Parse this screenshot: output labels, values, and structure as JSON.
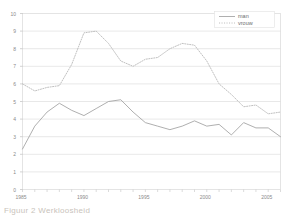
{
  "chart_data": {
    "type": "line",
    "title": "",
    "subtitle": "",
    "xlabel": "",
    "ylabel": "",
    "xlim": [
      1985,
      2006
    ],
    "ylim": [
      0,
      10
    ],
    "grid": true,
    "legend_position": "top-right",
    "x": [
      1985,
      1986,
      1987,
      1988,
      1989,
      1990,
      1991,
      1992,
      1993,
      1994,
      1995,
      1996,
      1997,
      1998,
      1999,
      2000,
      2001,
      2002,
      2003,
      2004,
      2005,
      2006
    ],
    "y_ticks": [
      "0",
      "1",
      "2",
      "3",
      "4",
      "5",
      "6",
      "7",
      "8",
      "9",
      "10"
    ],
    "x_ticks": [
      "1985",
      "1990",
      "1995",
      "2000",
      "2005"
    ],
    "series": [
      {
        "name": "man",
        "style": "solid",
        "color": "#9a9a9a",
        "values": [
          2.3,
          3.6,
          4.4,
          4.9,
          4.5,
          4.2,
          4.6,
          5.0,
          5.1,
          4.4,
          3.8,
          3.6,
          3.4,
          3.6,
          3.9,
          3.6,
          3.7,
          3.1,
          3.8,
          3.5,
          3.5,
          3.0
        ]
      },
      {
        "name": "vrouw",
        "style": "dotted",
        "color": "#b9b9b9",
        "values": [
          6.0,
          5.6,
          5.8,
          5.9,
          7.1,
          8.9,
          9.0,
          8.3,
          7.3,
          7.0,
          7.4,
          7.5,
          8.0,
          8.3,
          8.2,
          7.3,
          6.0,
          5.4,
          4.7,
          4.8,
          4.3,
          4.4
        ]
      }
    ],
    "legend": [
      {
        "label": "man",
        "style": "solid",
        "color": "#9a9a9a"
      },
      {
        "label": "vrouw",
        "style": "dotted",
        "color": "#b9b9b9"
      }
    ]
  },
  "caption": {
    "text": "Figuur 2  Werkloosheid"
  }
}
